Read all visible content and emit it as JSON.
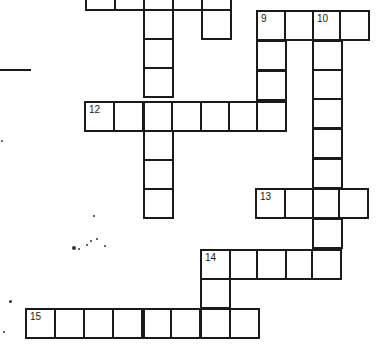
{
  "puzzle": {
    "type": "crossword",
    "cell_size": 29,
    "colors": {
      "line": "#1a1a1a",
      "background": "#ffffff"
    },
    "clue_numbers": [
      "9",
      "10",
      "12",
      "13",
      "14",
      "15"
    ],
    "cells": [
      {
        "x": 85,
        "y": -20,
        "num": null
      },
      {
        "x": 114,
        "y": -20,
        "num": null
      },
      {
        "x": 143,
        "y": -20,
        "num": null
      },
      {
        "x": 172,
        "y": -20,
        "num": null
      },
      {
        "x": 201,
        "y": -20,
        "num": null
      },
      {
        "x": 201,
        "y": 9,
        "num": null
      },
      {
        "x": 143,
        "y": 9,
        "num": null
      },
      {
        "x": 143,
        "y": 38,
        "num": null
      },
      {
        "x": 143,
        "y": 67,
        "num": null
      },
      {
        "x": 143,
        "y": 130,
        "num": null
      },
      {
        "x": 143,
        "y": 159,
        "num": null
      },
      {
        "x": 143,
        "y": 188,
        "num": null
      },
      {
        "x": 256,
        "y": 10,
        "num": "9"
      },
      {
        "x": 284,
        "y": 10,
        "num": null
      },
      {
        "x": 312,
        "y": 10,
        "num": "10"
      },
      {
        "x": 339,
        "y": 10,
        "num": null
      },
      {
        "x": 256,
        "y": 40,
        "num": null
      },
      {
        "x": 256,
        "y": 70,
        "num": null
      },
      {
        "x": 312,
        "y": 40,
        "num": null
      },
      {
        "x": 312,
        "y": 69,
        "num": null
      },
      {
        "x": 312,
        "y": 98,
        "num": null
      },
      {
        "x": 312,
        "y": 128,
        "num": null
      },
      {
        "x": 312,
        "y": 158,
        "num": null
      },
      {
        "x": 312,
        "y": 218,
        "num": null
      },
      {
        "x": 84,
        "y": 101,
        "num": "12"
      },
      {
        "x": 113,
        "y": 101,
        "num": null
      },
      {
        "x": 143,
        "y": 101,
        "num": null
      },
      {
        "x": 171,
        "y": 101,
        "num": null
      },
      {
        "x": 200,
        "y": 101,
        "num": null
      },
      {
        "x": 228,
        "y": 101,
        "num": null
      },
      {
        "x": 256,
        "y": 101,
        "num": null
      },
      {
        "x": 255,
        "y": 188,
        "num": "13"
      },
      {
        "x": 284,
        "y": 188,
        "num": null
      },
      {
        "x": 312,
        "y": 188,
        "num": null
      },
      {
        "x": 338,
        "y": 188,
        "num": null
      },
      {
        "x": 200,
        "y": 249,
        "num": "14"
      },
      {
        "x": 229,
        "y": 249,
        "num": null
      },
      {
        "x": 256,
        "y": 249,
        "num": null
      },
      {
        "x": 285,
        "y": 249,
        "num": null
      },
      {
        "x": 311,
        "y": 249,
        "num": null
      },
      {
        "x": 200,
        "y": 278,
        "num": null
      },
      {
        "x": 25,
        "y": 308,
        "num": "15"
      },
      {
        "x": 54,
        "y": 308,
        "num": null
      },
      {
        "x": 83,
        "y": 308,
        "num": null
      },
      {
        "x": 112,
        "y": 308,
        "num": null
      },
      {
        "x": 143,
        "y": 308,
        "num": null
      },
      {
        "x": 170,
        "y": 308,
        "num": null
      },
      {
        "x": 200,
        "y": 308,
        "num": null
      },
      {
        "x": 229,
        "y": 308,
        "num": null
      }
    ],
    "decorations": {
      "left_rule": {
        "x": 0,
        "y": 69,
        "w": 31,
        "h": 2
      },
      "specks": [
        {
          "x": 72,
          "y": 246,
          "r": 2
        },
        {
          "x": 78,
          "y": 248,
          "r": 1
        },
        {
          "x": 86,
          "y": 244,
          "r": 1
        },
        {
          "x": 90,
          "y": 240,
          "r": 1
        },
        {
          "x": 96,
          "y": 238,
          "r": 1
        },
        {
          "x": 104,
          "y": 245,
          "r": 1
        },
        {
          "x": 93,
          "y": 215,
          "r": 1
        },
        {
          "x": 9,
          "y": 300,
          "r": 1.5
        },
        {
          "x": 3,
          "y": 331,
          "r": 1
        },
        {
          "x": 1,
          "y": 140,
          "r": 1
        }
      ]
    }
  }
}
